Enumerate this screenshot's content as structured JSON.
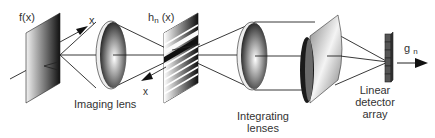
{
  "diagram": {
    "type": "optical-system-schematic",
    "labels": {
      "input_plane": "f(x)",
      "input_axis": "x",
      "mask_main": "h",
      "mask_sub": "n",
      "mask_arg": "(x)",
      "mask_axis": "x",
      "imaging_lens": "Imaging lens",
      "integrating_lenses_1": "Integrating",
      "integrating_lenses_2": "lenses",
      "detector_1": "Linear",
      "detector_2": "detector",
      "detector_3": "array",
      "output_main": "g",
      "output_sub": "n"
    },
    "components": [
      {
        "id": "input-plane",
        "name": "f(x)"
      },
      {
        "id": "imaging-lens",
        "name": "Imaging lens"
      },
      {
        "id": "mask-plane",
        "name": "h_n(x)"
      },
      {
        "id": "integrating-lenses",
        "name": "Integrating lenses"
      },
      {
        "id": "linear-detector-array",
        "name": "Linear detector array"
      },
      {
        "id": "output",
        "name": "g_n"
      }
    ],
    "colors": {
      "line": "#222222",
      "text": "#333333"
    }
  }
}
